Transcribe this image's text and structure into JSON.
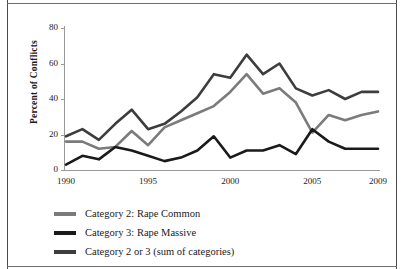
{
  "chart_data": {
    "type": "line",
    "title": "",
    "xlabel": "",
    "ylabel": "Percent of Conflicts",
    "xlim": [
      1990,
      2009
    ],
    "ylim": [
      0,
      80
    ],
    "grid": false,
    "legend_position": "bottom-left",
    "x": [
      1990,
      1991,
      1992,
      1993,
      1994,
      1995,
      1996,
      1997,
      1998,
      1999,
      2000,
      2001,
      2002,
      2003,
      2004,
      2005,
      2006,
      2007,
      2008,
      2009
    ],
    "xticks": [
      1990,
      1995,
      2000,
      2005,
      2009
    ],
    "yticks": [
      0,
      20,
      40,
      60,
      80
    ],
    "series": [
      {
        "name": "Category 2: Rape Common",
        "color": "#7b7b7b",
        "values": [
          16,
          16,
          12,
          13,
          22,
          14,
          24,
          28,
          32,
          36,
          44,
          54,
          43,
          46,
          38,
          21,
          31,
          28,
          31,
          33
        ]
      },
      {
        "name": "Category 3: Rape Massive",
        "color": "#1a1a1a",
        "values": [
          3,
          8,
          6,
          13,
          11,
          8,
          5,
          7,
          11,
          19,
          7,
          11,
          11,
          14,
          9,
          23,
          16,
          12,
          12,
          12
        ]
      },
      {
        "name": "Category 2 or 3 (sum of categories)",
        "color": "#3d3d3d",
        "values": [
          19,
          23,
          17,
          26,
          34,
          23,
          26,
          33,
          41,
          54,
          52,
          65,
          54,
          60,
          46,
          42,
          45,
          40,
          44,
          44
        ]
      }
    ]
  },
  "axes": {
    "ylabel": "Percent of Conflicts",
    "ytick_labels": [
      "80",
      "60",
      "40",
      "20",
      "0"
    ],
    "xtick_labels": [
      "1990",
      "1995",
      "2000",
      "2005",
      "2009"
    ]
  },
  "legend": {
    "items": [
      {
        "label": "Category 2: Rape Common",
        "color": "#7b7b7b"
      },
      {
        "label": "Category 3: Rape Massive",
        "color": "#1a1a1a"
      },
      {
        "label": "Category 2 or 3 (sum of categories)",
        "color": "#3d3d3d"
      }
    ]
  }
}
